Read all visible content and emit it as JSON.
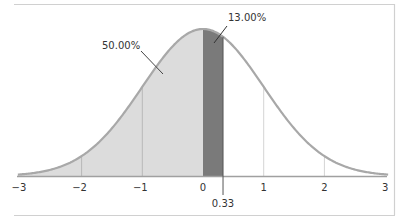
{
  "chart_data": {
    "type": "area",
    "title": "",
    "xlabel": "",
    "ylabel": "",
    "distribution": "standard normal",
    "mean": 0,
    "sd": 1,
    "xlim": [
      -3,
      3
    ],
    "x_ticks": [
      -3,
      -2,
      -1,
      0,
      1,
      2,
      3
    ],
    "x_tick_labels": [
      "−3",
      "−2",
      "−1",
      "0",
      "1",
      "2",
      "3"
    ],
    "gridlines": [
      -2,
      -1,
      1,
      2
    ],
    "regions": [
      {
        "name": "left-half",
        "from": -3,
        "to": 0,
        "area_label": "50.00%",
        "color": "#dcdcdc"
      },
      {
        "name": "zero-to-z",
        "from": 0,
        "to": 0.33,
        "area_label": "13.00%",
        "color": "#7a7a7a"
      }
    ],
    "marker": {
      "x": 0.33,
      "label": "0.33"
    },
    "curve_color": "#a8a8a8",
    "grid": false,
    "legend": "none"
  },
  "labels": {
    "region_left": "50.00%",
    "region_mid": "13.00%",
    "marker": "0.33",
    "ticks": [
      "−3",
      "−2",
      "−1",
      "0",
      "1",
      "2",
      "3"
    ]
  }
}
